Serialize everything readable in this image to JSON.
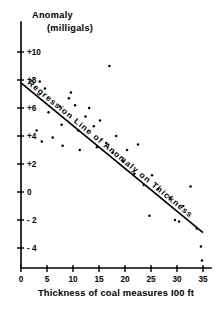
{
  "chart_data": {
    "type": "scatter",
    "title": "Anomaly",
    "subtitle": "(milligals)",
    "xlabel": "Thickness of coal measures  I00 ft",
    "ylabel": "Anomaly (milligals)",
    "xlim": [
      0,
      35
    ],
    "ylim": [
      -5,
      11
    ],
    "grid": false,
    "legend": null,
    "xticks": [
      0,
      5,
      10,
      15,
      20,
      25,
      30,
      35
    ],
    "xtick_labels": [
      "0",
      "5",
      "10",
      "15",
      "20",
      "25",
      "30",
      "35"
    ],
    "yticks": [
      10,
      8,
      6,
      4,
      2,
      0,
      -2,
      -4
    ],
    "ytick_labels": [
      "+10",
      "+8",
      "+6",
      "+4",
      "+2",
      "0",
      "- 2",
      "- 4"
    ],
    "annotations": [
      {
        "text": "Regression  Line  of  Anomaly  on  Thickness",
        "name": "regression-line-label"
      }
    ],
    "series": [
      {
        "name": "Anomaly vs Thickness",
        "marker": "dot",
        "color": "#000000",
        "points": [
          [
            3.6,
            7.9
          ],
          [
            4.6,
            7.4
          ],
          [
            5.3,
            5.7
          ],
          [
            3.0,
            4.4
          ],
          [
            4.0,
            3.6
          ],
          [
            6.1,
            3.9
          ],
          [
            7.5,
            6.1
          ],
          [
            7.8,
            4.8
          ],
          [
            8.0,
            3.3
          ],
          [
            9.2,
            6.7
          ],
          [
            9.6,
            7.1
          ],
          [
            10.4,
            6.2
          ],
          [
            11.0,
            4.4
          ],
          [
            11.3,
            3.0
          ],
          [
            12.4,
            5.4
          ],
          [
            13.1,
            6.0
          ],
          [
            14.0,
            4.7
          ],
          [
            14.6,
            3.2
          ],
          [
            15.2,
            5.1
          ],
          [
            16.4,
            3.5
          ],
          [
            17.0,
            9.0
          ],
          [
            17.6,
            2.8
          ],
          [
            18.3,
            4.0
          ],
          [
            19.6,
            2.2
          ],
          [
            20.4,
            3.0
          ],
          [
            21.8,
            1.3
          ],
          [
            22.5,
            3.4
          ],
          [
            23.6,
            0.5
          ],
          [
            24.7,
            -1.7
          ],
          [
            25.2,
            1.2
          ],
          [
            26.3,
            0.2
          ],
          [
            28.6,
            -0.4
          ],
          [
            29.6,
            -2.0
          ],
          [
            30.4,
            -2.1
          ],
          [
            31.2,
            -1.0
          ],
          [
            32.6,
            0.4
          ],
          [
            33.8,
            -2.6
          ],
          [
            34.6,
            -3.9
          ],
          [
            34.8,
            -4.9
          ]
        ]
      }
    ],
    "fit_line": {
      "name": "regression-line",
      "x_start": 0,
      "y_start": 7.8,
      "x_end": 35,
      "y_end": -2.9
    }
  }
}
